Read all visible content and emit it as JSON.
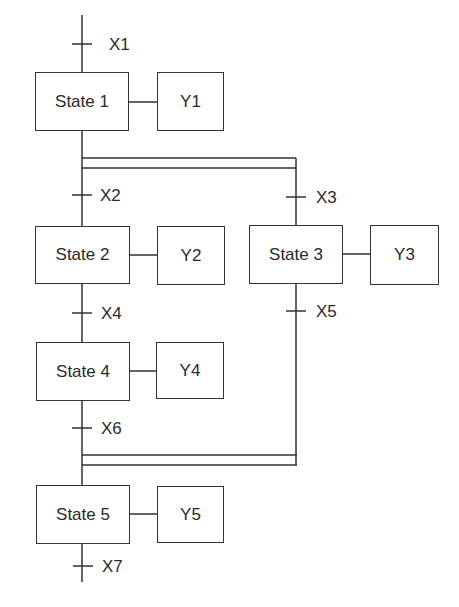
{
  "diagram": {
    "type": "sequential function chart",
    "states": [
      {
        "id": "s1",
        "label": "State 1",
        "action": "Y1"
      },
      {
        "id": "s2",
        "label": "State 2",
        "action": "Y2"
      },
      {
        "id": "s3",
        "label": "State 3",
        "action": "Y3"
      },
      {
        "id": "s4",
        "label": "State 4",
        "action": "Y4"
      },
      {
        "id": "s5",
        "label": "State 5",
        "action": "Y5"
      }
    ],
    "transitions": [
      {
        "label": "X1",
        "to": "s1"
      },
      {
        "label": "X2",
        "from": "s1",
        "to": "s2"
      },
      {
        "label": "X3",
        "from": "s1",
        "to": "s3"
      },
      {
        "label": "X4",
        "from": "s2",
        "to": "s4"
      },
      {
        "label": "X5",
        "from": "s3",
        "to": "s5"
      },
      {
        "label": "X6",
        "from": "s4",
        "to": "s5"
      },
      {
        "label": "X7",
        "from": "s5"
      }
    ],
    "divergence": "OR (double line) after State 1",
    "convergence": "OR (double line) before State 5",
    "line_color": "#333333"
  }
}
